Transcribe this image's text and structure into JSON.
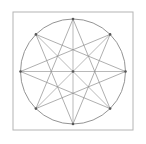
{
  "figure": {
    "name": "eight-point-star-construction",
    "canvas": {
      "width": 146,
      "height": 144,
      "background": "#ffffff"
    },
    "square": {
      "x": 13,
      "y": 12,
      "width": 120,
      "height": 118,
      "stroke": "#b4b4b4",
      "stroke_width": 1,
      "fill": "#ffffff"
    },
    "circle": {
      "cx": 73,
      "cy": 71.5,
      "r": 52.5,
      "stroke": "#949494",
      "stroke_width": 1,
      "fill": "none"
    },
    "points": {
      "N": [
        73,
        19
      ],
      "NE": [
        110.1,
        34.4
      ],
      "E": [
        125.5,
        71.5
      ],
      "SE": [
        110.1,
        108.6
      ],
      "S": [
        73,
        124
      ],
      "SW": [
        35.9,
        108.6
      ],
      "W": [
        20.5,
        71.5
      ],
      "NW": [
        35.9,
        34.4
      ],
      "center": [
        73,
        71.5
      ]
    },
    "diameters": {
      "stroke": "#b9b9b9",
      "stroke_width": 1,
      "lines": [
        [
          "N",
          "S"
        ],
        [
          "E",
          "W"
        ],
        [
          "NE",
          "SW"
        ],
        [
          "NW",
          "SE"
        ]
      ]
    },
    "chords": {
      "stroke": "#8c8c8c",
      "stroke_width": 0.7,
      "lines": [
        [
          "N",
          "SE"
        ],
        [
          "NE",
          "S"
        ],
        [
          "E",
          "SW"
        ],
        [
          "SE",
          "W"
        ],
        [
          "S",
          "NW"
        ],
        [
          "SW",
          "N"
        ],
        [
          "W",
          "NE"
        ],
        [
          "NW",
          "E"
        ]
      ]
    },
    "dots": {
      "fill": "#575757",
      "radius": 1.3,
      "at": [
        "N",
        "NE",
        "E",
        "SE",
        "S",
        "SW",
        "W",
        "NW",
        "center"
      ]
    }
  }
}
